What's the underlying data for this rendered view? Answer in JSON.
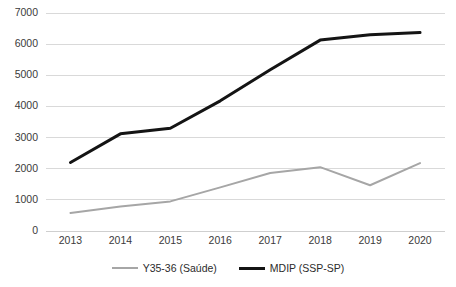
{
  "chart_data": {
    "type": "line",
    "title": "",
    "xlabel": "",
    "ylabel": "",
    "categories": [
      "2013",
      "2014",
      "2015",
      "2016",
      "2017",
      "2018",
      "2019",
      "2020"
    ],
    "x": [
      2013,
      2014,
      2015,
      2016,
      2017,
      2018,
      2019,
      2020
    ],
    "ylim": [
      0,
      7000
    ],
    "yticks": [
      0,
      1000,
      2000,
      3000,
      4000,
      5000,
      6000,
      7000
    ],
    "ytick_labels": [
      "0",
      "1000",
      "2000",
      "3000",
      "4000",
      "5000",
      "6000",
      "7000"
    ],
    "grid": true,
    "grid_axis": "y",
    "legend_position": "bottom",
    "series": [
      {
        "name": "Y35-36 (Saúde)",
        "color": "#a6a6a6",
        "line_width": 2,
        "values": [
          580,
          790,
          950,
          1400,
          1860,
          2050,
          1470,
          2180
        ]
      },
      {
        "name": "MDIP (SSP-SP)",
        "color": "#141414",
        "line_width": 3,
        "values": [
          2200,
          3120,
          3300,
          4180,
          5180,
          6130,
          6300,
          6370
        ]
      }
    ]
  },
  "axis": {
    "baseline_color": "#cfcfcf",
    "gridline_color": "#d9d9d9"
  }
}
